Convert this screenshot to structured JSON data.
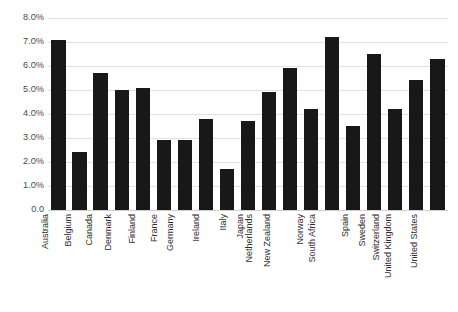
{
  "chart_data": {
    "type": "bar",
    "title": "",
    "xlabel": "",
    "ylabel": "",
    "ylim": [
      0,
      8
    ],
    "grid": true,
    "legend": false,
    "bar_color": "#181818",
    "gridline_color": "#e2e2e2",
    "y_ticks": [
      "0.0",
      "1.0%",
      "2.0%",
      "3.0%",
      "4.0%",
      "5.0%",
      "6.0%",
      "7.0%",
      "8.0%"
    ],
    "y_tick_values": [
      0,
      1,
      2,
      3,
      4,
      5,
      6,
      7,
      8
    ],
    "categories": [
      "Australia",
      "Belgium",
      "Canada",
      "Denmark",
      "Finland",
      "France",
      "Germany",
      "Ireland",
      "Italy",
      "Japan",
      "Netherlands",
      "New Zealand",
      "Norway",
      "South Africa",
      "Spain",
      "Sweden",
      "Switzerland",
      "United Kingdom",
      "United States"
    ],
    "values": [
      7.1,
      2.4,
      5.7,
      5.0,
      5.1,
      2.9,
      2.9,
      3.8,
      1.7,
      3.7,
      4.9,
      5.9,
      4.2,
      7.2,
      3.5,
      6.5,
      4.2,
      5.4,
      6.3
    ]
  }
}
